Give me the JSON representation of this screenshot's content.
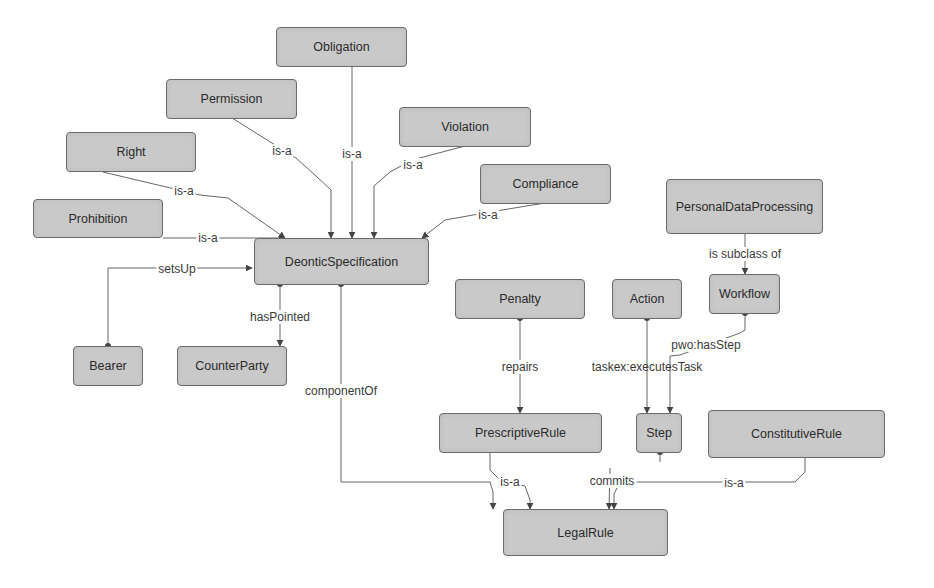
{
  "diagram": {
    "type": "ontology-class-diagram",
    "colors": {
      "node_fill": "#c9c9c9",
      "node_border": "#6b6b6b",
      "edge": "#555555",
      "text": "#2a2a2a"
    },
    "nodes": {
      "obligation": "Obligation",
      "permission": "Permission",
      "right": "Right",
      "violation": "Violation",
      "compliance": "Compliance",
      "prohibition": "Prohibition",
      "deontic_specification": "DeonticSpecification",
      "personal_data_processing": "PersonalDataProcessing",
      "workflow": "Workflow",
      "bearer": "Bearer",
      "counter_party": "CounterParty",
      "penalty": "Penalty",
      "action": "Action",
      "prescriptive_rule": "PrescriptiveRule",
      "step": "Step",
      "constitutive_rule": "ConstitutiveRule",
      "legal_rule": "LegalRule"
    },
    "edges": [
      {
        "from": "Obligation",
        "to": "DeonticSpecification",
        "label": "is-a"
      },
      {
        "from": "Permission",
        "to": "DeonticSpecification",
        "label": "is-a"
      },
      {
        "from": "Right",
        "to": "DeonticSpecification",
        "label": "is-a"
      },
      {
        "from": "Violation",
        "to": "DeonticSpecification",
        "label": "is-a"
      },
      {
        "from": "Compliance",
        "to": "DeonticSpecification",
        "label": "is-a"
      },
      {
        "from": "Prohibition",
        "to": "DeonticSpecification",
        "label": "is-a"
      },
      {
        "from": "Bearer",
        "to": "DeonticSpecification",
        "label": "setsUp"
      },
      {
        "from": "DeonticSpecification",
        "to": "CounterParty",
        "label": "hasPointed"
      },
      {
        "from": "DeonticSpecification",
        "to": "LegalRule",
        "label": "componentOf"
      },
      {
        "from": "PersonalDataProcessing",
        "to": "Workflow",
        "label": "is subclass of"
      },
      {
        "from": "Penalty",
        "to": "PrescriptiveRule",
        "label": "repairs"
      },
      {
        "from": "Action",
        "to": "Step",
        "label": "taskex:executesTask"
      },
      {
        "from": "Workflow",
        "to": "Step",
        "label": "pwo:hasStep"
      },
      {
        "from": "PrescriptiveRule",
        "to": "LegalRule",
        "label": "is-a"
      },
      {
        "from": "Step",
        "to": "LegalRule",
        "label": "commits"
      },
      {
        "from": "ConstitutiveRule",
        "to": "LegalRule",
        "label": "is-a"
      }
    ],
    "labels": {
      "is_a": "is-a",
      "sets_up": "setsUp",
      "has_pointed": "hasPointed",
      "component_of": "componentOf",
      "is_subclass_of": "is subclass of",
      "repairs": "repairs",
      "executes_task": "taskex:executesTask",
      "has_step": "pwo:hasStep",
      "commits": "commits"
    }
  }
}
